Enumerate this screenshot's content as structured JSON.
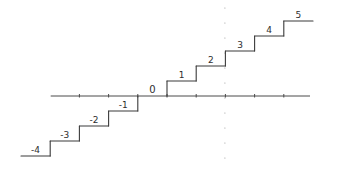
{
  "diagram": {
    "type": "step-function",
    "axis": {
      "x_ticks": [
        -3,
        -2,
        -1,
        0,
        1,
        2,
        3,
        4
      ]
    },
    "steps": [
      {
        "label": "-4",
        "value": -4
      },
      {
        "label": "-3",
        "value": -3
      },
      {
        "label": "-2",
        "value": -2
      },
      {
        "label": "-1",
        "value": -1
      },
      {
        "label": "0",
        "value": 0
      },
      {
        "label": "1",
        "value": 1
      },
      {
        "label": "2",
        "value": 2
      },
      {
        "label": "3",
        "value": 3
      },
      {
        "label": "4",
        "value": 4
      },
      {
        "label": "5",
        "value": 5
      }
    ],
    "dotted_vertical_at_x": 2,
    "colors": {
      "ink": "#3a3a3a",
      "background": "#ffffff",
      "dots": "#9a9a9a"
    }
  }
}
